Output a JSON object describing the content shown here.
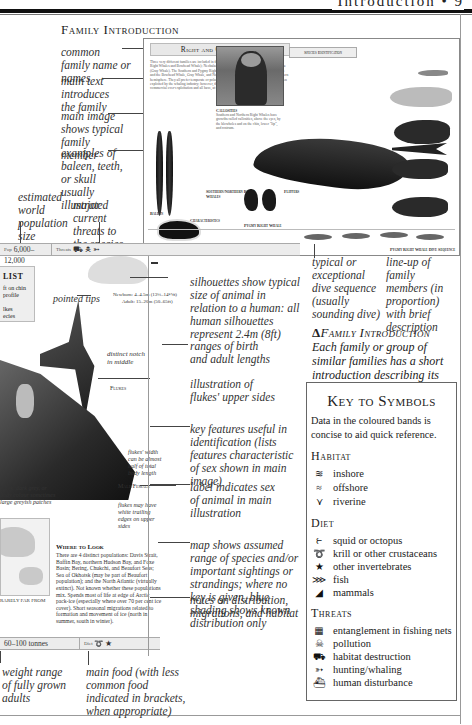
{
  "running_head": "Introduction • 9",
  "section_title": "Family Introduction",
  "annotations_left": [
    {
      "id": "common-family-name",
      "text": "common family name or names"
    },
    {
      "id": "main-text",
      "text": "main text introduces the family"
    },
    {
      "id": "main-image",
      "text": "main image shows typical family member"
    },
    {
      "id": "baleen-examples",
      "text": "examples of baleen, teeth, or skull usually illustrated"
    },
    {
      "id": "population",
      "text": "estimated world population size"
    },
    {
      "id": "threats",
      "text": "major current threats to the species"
    }
  ],
  "spread": {
    "family_title": "Right and Gray Whales",
    "intro_text": "Three very different families are included in this section: Balaenidae (Southern and Northern Right Whales and Bowhead Whale); Neobalaenidae (Pygmy Right Whale); and Eschrichtiidae (Gray Whale). The Southern and Pygmy Right Whales occur only in the southern hemisphere and the Bowhead Whale, Gray Whale, and Northern Right Whale are found only in the northern hemisphere. They all prefer temperate or polar waters. The Pygmy Right Whale has never been exploited by the whaling industry; however, the 4 larger species have suffered from ruthless commercial over-exploitation and all have, at some time, been close to extinction.",
    "species_id_title": "Species Identification",
    "captions": {
      "single_arched_mandible": "straight arched mandible (except Gray Whale)",
      "top_jaw": "as top jaw in the Pygmy Right Whale",
      "baleen": "Baleen",
      "baleen_text": "Bowhead Whales and Northern and Southern Right Whales have very long baleen plates; Gray Whale baleen is short",
      "callosities": "Callosities",
      "callosities_text": "Southern and Northern Right Whales have growths called callosities, above the eyes, by the blowholes and on the chin, lower \"lip\", and rostrum.",
      "south_north_right": "Southern/Northern Right Whales",
      "characteristics": "Characteristics",
      "bowhead_skull": "Bowhead Whale Skull",
      "flippers": "Flippers",
      "right_whale": "Right Whale",
      "bowhead_whale": "Bowhead Whale",
      "pygmy_right": "Pygmy Right Whale",
      "lineup_caption": "Pygmy Right Whale Dive Sequence",
      "pygmy_species": "Pygmy Right Whale",
      "gray_species": "Gray Whale",
      "bowhead_species": "Bowhead Whale",
      "northern_species": "Northern Right Whale",
      "southern_species": "Southern Right Whale"
    }
  },
  "data_band": {
    "population_label": "Pop",
    "population_value": "6,000–12,000",
    "threats_label": "Threats"
  },
  "checklist": {
    "title": "LIST",
    "rows": [
      "ft on chin",
      "profile",
      "",
      "lkes",
      "ecies"
    ]
  },
  "annotations_mid": [
    {
      "id": "pointed-tips",
      "text": "pointed tips"
    },
    {
      "id": "lengths-newborn",
      "text": "Newborn: 4–4.5m (13¼–14½ft)"
    },
    {
      "id": "lengths-adult",
      "text": "Adult: 15–20m (50–65ft)"
    },
    {
      "id": "distinct-notch",
      "text": "distinct notch in middle"
    },
    {
      "id": "flukes-label",
      "text": "Flukes"
    },
    {
      "id": "flukes-width",
      "text": "flukes' width can be almost half of total body length"
    },
    {
      "id": "male-female",
      "text": "Male/Female"
    },
    {
      "id": "flukes-white",
      "text": "flukes may have white trailing edges on upper sides"
    },
    {
      "id": "colour-note",
      "text": "black, dark grey, or body colour sometimes large greyish patches"
    }
  ],
  "annotations_right": [
    {
      "id": "silhouettes",
      "text": "silhouettes show typical size of animal in relation to a human: all human silhouettes represent 2.4m (8ft)"
    },
    {
      "id": "lengths",
      "text": "ranges of birth and adult lengths"
    },
    {
      "id": "flukes-illustration",
      "text": "illustration of flukes' upper sides"
    },
    {
      "id": "key-features",
      "text": "key features useful in identification (lists features characteristic of sex shown in main image)"
    },
    {
      "id": "sex-label",
      "text": "label indicates sex of animal in main illustration"
    },
    {
      "id": "map",
      "text": "map shows assumed range of species and/or important sightings or strandings; where no key is given, blue shading shows known distribution only"
    },
    {
      "id": "notes",
      "text": "notes on distribution, migrations, and habitat"
    },
    {
      "id": "dive",
      "text": "typical or exceptional dive sequence (usually sounding dive)"
    },
    {
      "id": "lineup",
      "text": "line-up of family members (in proportion) with brief description"
    }
  ],
  "annotations_bottom": [
    {
      "id": "weight",
      "text": "weight range of fully grown adults"
    },
    {
      "id": "food",
      "text": "main food (with less common food indicated in brackets, when appropriate)"
    }
  ],
  "where_to_look": {
    "title": "Where to Look",
    "text": "There are 4 distinct populations: Davis Strait, Baffin Bay, northern Hudson Bay, and Foxe Basin; Bering, Chukchi, and Beaufort Seas; Sea of Okhotsk (may be part of Beaufort population); and the North Atlantic (virtually extinct). Not known whether these populations mix. Spends most of life at edge of Arctic pack-ice (especially where over 70 per cent ice cover). Short seasonal migrations related to formation and movement of ice (north in summer, south in winter).",
    "map_caption": "RARELY FAR FROM"
  },
  "bottom_band": {
    "weight_value": "60–100 tonnes",
    "diet_label": "Diet"
  },
  "intro_heading": "Family Introduction",
  "intro_text": "Each family or group of similar families has a short introduction describing its main characteristics.",
  "key": {
    "title": "Key to Symbols",
    "description": "Data in the coloured bands is concise to aid quick reference.",
    "habitat_title": "Habitat",
    "habitat": [
      {
        "icon": "inshore-icon",
        "glyph": "≋",
        "label": "inshore"
      },
      {
        "icon": "offshore-icon",
        "glyph": "≈",
        "label": "offshore"
      },
      {
        "icon": "riverine-icon",
        "glyph": "⋎",
        "label": "riverine"
      }
    ],
    "diet_title": "Diet",
    "diet": [
      {
        "icon": "squid-icon",
        "glyph": "⥼",
        "label": "squid or octopus"
      },
      {
        "icon": "krill-icon",
        "glyph": "➰",
        "label": "krill or other crustaceans"
      },
      {
        "icon": "star-icon",
        "glyph": "★",
        "label": "other invertebrates"
      },
      {
        "icon": "fish-icon",
        "glyph": "⋙",
        "label": "fish"
      },
      {
        "icon": "mammal-icon",
        "glyph": "◢",
        "label": "mammals"
      }
    ],
    "threats_title": "Threats",
    "threats": [
      {
        "icon": "net-icon",
        "glyph": "▦",
        "label": "entanglement in fishing nets"
      },
      {
        "icon": "skull-icon",
        "glyph": "☠",
        "label": "pollution"
      },
      {
        "icon": "tractor-icon",
        "glyph": "⛟",
        "label": "habitat destruction"
      },
      {
        "icon": "harpoon-icon",
        "glyph": "➳",
        "label": "hunting/whaling"
      },
      {
        "icon": "boat-icon",
        "glyph": "⛴",
        "label": "human disturbance"
      }
    ]
  }
}
